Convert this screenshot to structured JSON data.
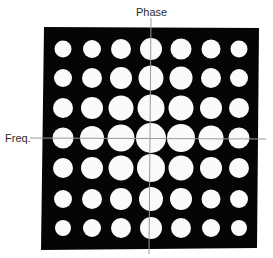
{
  "figure": {
    "background": "#ffffff",
    "panel_color": "#050505",
    "dot_color": "#fafafa",
    "axis_color": "#9a9a9a",
    "labels": {
      "vertical_axis": "Phase",
      "horizontal_axis": "Freq."
    },
    "panel": {
      "corners": [
        [
          44,
          27
        ],
        [
          259,
          28
        ],
        [
          257,
          248
        ],
        [
          41,
          250
        ]
      ]
    },
    "axes": {
      "vertical": {
        "x1": 151,
        "y1": 18,
        "x2": 149,
        "y2": 254
      },
      "horizontal": {
        "x1": 30,
        "y1": 138,
        "x2": 266,
        "y2": 139
      }
    },
    "grid": {
      "rows": 7,
      "cols": 7,
      "col_centers": [
        63,
        92,
        121,
        151,
        181,
        211,
        239
      ],
      "row_centers": [
        49,
        78,
        108,
        138,
        168,
        199,
        228
      ],
      "diameters": [
        [
          17,
          18,
          20,
          22,
          21,
          19,
          17
        ],
        [
          18,
          20,
          22,
          25,
          23,
          20,
          18
        ],
        [
          20,
          22,
          25,
          27,
          25,
          22,
          20
        ],
        [
          21,
          24,
          27,
          30,
          28,
          25,
          21
        ],
        [
          20,
          22,
          25,
          28,
          25,
          22,
          20
        ],
        [
          18,
          20,
          22,
          24,
          22,
          19,
          18
        ],
        [
          16,
          18,
          20,
          22,
          20,
          18,
          16
        ]
      ]
    }
  }
}
